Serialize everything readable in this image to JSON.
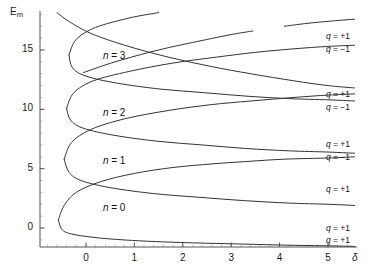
{
  "chart_data": {
    "type": "line",
    "title": "",
    "xlabel": "δ",
    "ylabel": "E_m",
    "xlim": [
      -0.95,
      5.6
    ],
    "ylim": [
      -1.6,
      18.2
    ],
    "xticks": [
      0,
      1,
      2,
      3,
      4,
      5
    ],
    "yticks": [
      0,
      5,
      10,
      15
    ],
    "xtick_labels": [
      "0",
      "1",
      "2",
      "3",
      "4",
      "5"
    ],
    "ytick_labels": [
      "0",
      "5",
      "10",
      "15"
    ],
    "grid": false,
    "legend": "none",
    "minor_ticks": true,
    "line_color": "#333333",
    "line_width": 1.0,
    "background": "#ffffff",
    "axis_color": "#555555",
    "band_labels": [
      {
        "text": "n = 3",
        "x": 0.35,
        "y": 14.4
      },
      {
        "text": "n = 2",
        "x": 0.35,
        "y": 9.6
      },
      {
        "text": "n = 1",
        "x": 0.35,
        "y": 5.6
      },
      {
        "text": "n = 0",
        "x": 0.35,
        "y": 1.6
      }
    ],
    "edge_labels": [
      {
        "text": "q = +1",
        "x": 5.0,
        "y": 16.1
      },
      {
        "text": "q = -1",
        "x": 5.0,
        "y": 15.0
      },
      {
        "text": "q = +1",
        "x": 5.0,
        "y": 11.2
      },
      {
        "text": "q = -1",
        "x": 5.0,
        "y": 10.1
      },
      {
        "text": "q = +1",
        "x": 5.0,
        "y": 7.0
      },
      {
        "text": "q = -1",
        "x": 5.0,
        "y": 5.9
      },
      {
        "text": "q = +1",
        "x": 5.0,
        "y": 3.2
      },
      {
        "text": "q = +1",
        "x": 5.0,
        "y": -0.1
      },
      {
        "text": "q = +1",
        "x": 5.0,
        "y": -1.1
      }
    ],
    "series": [
      {
        "name": "band-0-upper",
        "comment": "n = 0 loop upper branch",
        "points": [
          [
            -0.57,
            0.7
          ],
          [
            -0.45,
            1.9
          ],
          [
            -0.2,
            3.0
          ],
          [
            0.3,
            3.9
          ],
          [
            1.0,
            4.6
          ],
          [
            1.8,
            5.1
          ],
          [
            2.6,
            5.4
          ],
          [
            3.3,
            5.6
          ],
          [
            4.1,
            5.8
          ],
          [
            5.0,
            5.9
          ],
          [
            5.55,
            6.0
          ]
        ]
      },
      {
        "name": "band-0-lower",
        "comment": "n = 0 loop lower branch",
        "points": [
          [
            -0.57,
            0.7
          ],
          [
            -0.5,
            -0.1
          ],
          [
            -0.3,
            -0.5
          ],
          [
            0.3,
            -0.85
          ],
          [
            1.2,
            -1.1
          ],
          [
            2.2,
            -1.25
          ],
          [
            3.2,
            -1.35
          ],
          [
            4.2,
            -1.45
          ],
          [
            5.0,
            -1.5
          ],
          [
            5.55,
            -1.55
          ]
        ]
      },
      {
        "name": "band-1-upper",
        "comment": "n = 1 loop upper branch",
        "points": [
          [
            -0.45,
            5.8
          ],
          [
            -0.3,
            7.2
          ],
          [
            0.1,
            8.3
          ],
          [
            0.8,
            9.2
          ],
          [
            1.7,
            9.9
          ],
          [
            2.6,
            10.4
          ],
          [
            3.4,
            10.7
          ],
          [
            4.3,
            11.0
          ],
          [
            5.0,
            11.2
          ],
          [
            5.55,
            11.3
          ]
        ]
      },
      {
        "name": "band-1-lower",
        "comment": "n = 1 loop lower branch",
        "points": [
          [
            -0.45,
            5.8
          ],
          [
            -0.35,
            4.7
          ],
          [
            -0.1,
            4.0
          ],
          [
            0.5,
            3.4
          ],
          [
            1.4,
            2.9
          ],
          [
            2.3,
            2.6
          ],
          [
            3.3,
            2.3
          ],
          [
            4.2,
            2.1
          ],
          [
            5.0,
            2.0
          ],
          [
            5.55,
            1.9
          ]
        ]
      },
      {
        "name": "band-2-upper",
        "comment": "n = 2 loop upper branch",
        "points": [
          [
            -0.4,
            10.1
          ],
          [
            -0.25,
            11.4
          ],
          [
            0.15,
            12.4
          ],
          [
            0.9,
            13.2
          ],
          [
            1.8,
            13.9
          ],
          [
            2.7,
            14.4
          ],
          [
            3.5,
            14.8
          ],
          [
            4.3,
            15.1
          ],
          [
            5.0,
            15.3
          ],
          [
            5.55,
            15.4
          ]
        ]
      },
      {
        "name": "band-2-lower",
        "comment": "n = 2 loop lower branch",
        "points": [
          [
            -0.4,
            10.1
          ],
          [
            -0.32,
            9.1
          ],
          [
            -0.05,
            8.4
          ],
          [
            0.6,
            7.8
          ],
          [
            1.5,
            7.3
          ],
          [
            2.4,
            7.0
          ],
          [
            3.3,
            6.7
          ],
          [
            4.2,
            6.5
          ],
          [
            5.0,
            6.4
          ],
          [
            5.55,
            6.3
          ]
        ]
      },
      {
        "name": "band-3-upper",
        "comment": "n = 3 loop upper branch",
        "points": [
          [
            -0.35,
            14.6
          ],
          [
            -0.2,
            15.9
          ],
          [
            0.2,
            16.9
          ],
          [
            0.9,
            17.7
          ],
          [
            1.5,
            18.15
          ]
        ]
      },
      {
        "name": "band-3-lower",
        "comment": "n = 3 loop lower branch",
        "points": [
          [
            -0.35,
            14.6
          ],
          [
            -0.28,
            13.5
          ],
          [
            0.0,
            12.8
          ],
          [
            0.65,
            12.2
          ],
          [
            1.55,
            11.7
          ],
          [
            2.45,
            11.4
          ],
          [
            3.35,
            11.1
          ],
          [
            4.2,
            10.9
          ],
          [
            5.0,
            10.8
          ],
          [
            5.55,
            10.7
          ]
        ]
      },
      {
        "name": "descending-top",
        "comment": "descending branch entering from top-left",
        "points": [
          [
            -0.6,
            18.15
          ],
          [
            -0.35,
            17.4
          ],
          [
            0.1,
            16.4
          ],
          [
            0.8,
            15.4
          ],
          [
            1.7,
            14.4
          ],
          [
            2.6,
            13.6
          ],
          [
            3.4,
            13.0
          ],
          [
            4.3,
            12.4
          ],
          [
            5.0,
            12.0
          ],
          [
            5.55,
            11.8
          ]
        ]
      },
      {
        "name": "ascending-top",
        "comment": "ascending branch to upper right",
        "points": [
          [
            -0.05,
            13.1
          ],
          [
            0.6,
            14.0
          ],
          [
            1.5,
            15.0
          ],
          [
            2.4,
            15.8
          ],
          [
            3.0,
            16.3
          ],
          [
            3.45,
            16.6
          ]
        ]
      },
      {
        "name": "ascending-top-right",
        "comment": "short ascending segment at far top right",
        "points": [
          [
            4.1,
            17.0
          ],
          [
            4.7,
            17.3
          ],
          [
            5.55,
            17.6
          ]
        ]
      }
    ]
  },
  "axes": {
    "y_title": "E",
    "y_title_sub": "m",
    "x_title": "δ"
  }
}
